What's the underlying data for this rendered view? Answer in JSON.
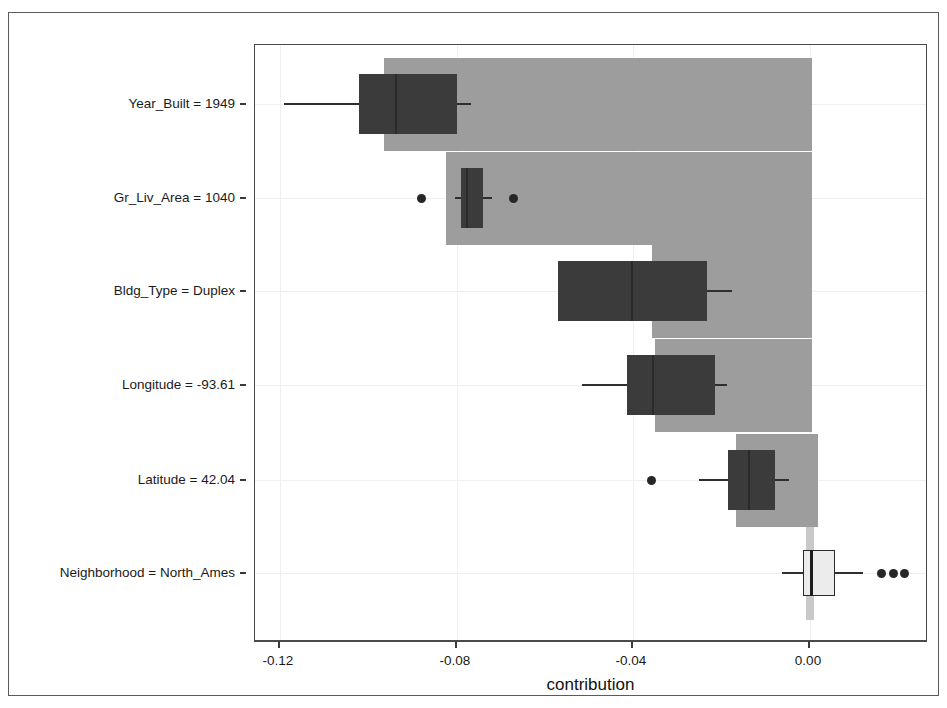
{
  "chart_data": {
    "type": "bar",
    "subtype": "break-down-boxplot-waterfall",
    "title": "",
    "xlabel": "contribution",
    "ylabel": "",
    "xlim": [
      -0.1332,
      0.0191
    ],
    "xticks": [
      -0.12,
      -0.08,
      -0.04,
      0.0
    ],
    "xtick_labels": [
      "-0.12",
      "-0.08",
      "-0.04",
      "0.00"
    ],
    "grid": true,
    "grid_axis": "both",
    "categories": [
      "Year_Built = 1949",
      "Gr_Liv_Area = 1040",
      "Bldg_Type = Duplex",
      "Longitude = -93.61",
      "Latitude = 42.04",
      "Neighborhood = North_Ames"
    ],
    "bars": [
      {
        "label": "Year_Built = 1949",
        "start": -0.0965,
        "end": 0.0005,
        "color": "#9d9d9d"
      },
      {
        "label": "Gr_Liv_Area = 1040",
        "start": -0.0825,
        "end": 0.0005,
        "color": "#9d9d9d"
      },
      {
        "label": "Bldg_Type = Duplex",
        "start": -0.0357,
        "end": 0.0005,
        "color": "#9d9d9d"
      },
      {
        "label": "Longitude = -93.61",
        "start": -0.035,
        "end": 0.0005,
        "color": "#9d9d9d"
      },
      {
        "label": "Latitude = 42.04",
        "start": -0.0167,
        "end": 0.0019,
        "color": "#9d9d9d"
      },
      {
        "label": "Neighborhood = North_Ames",
        "start": -0.001,
        "end": 0.001,
        "color": "#c9c9c9"
      }
    ],
    "boxplots": [
      {
        "label": "Year_Built = 1949",
        "lower_whisker": -0.1192,
        "q1": -0.1021,
        "median": -0.094,
        "q3": -0.0799,
        "upper_whisker": -0.0768,
        "outliers": [],
        "fill": "#3b3b3b"
      },
      {
        "label": "Gr_Liv_Area = 1040",
        "lower_whisker": -0.0804,
        "q1": -0.079,
        "median": -0.078,
        "q3": -0.0741,
        "upper_whisker": -0.072,
        "outliers": [
          -0.0879,
          -0.0672
        ],
        "fill": "#3b3b3b"
      },
      {
        "label": "Bldg_Type = Duplex",
        "lower_whisker": -0.0571,
        "q1": -0.0571,
        "median": -0.0406,
        "q3": -0.0233,
        "upper_whisker": -0.0177,
        "outliers": [],
        "fill": "#3b3b3b"
      },
      {
        "label": "Longitude = -93.61",
        "lower_whisker": -0.0516,
        "q1": -0.0414,
        "median": -0.0357,
        "q3": -0.0215,
        "upper_whisker": -0.0188,
        "outliers": [],
        "fill": "#3b3b3b"
      },
      {
        "label": "Latitude = 42.04",
        "lower_whisker": -0.0251,
        "q1": -0.0186,
        "median": -0.014,
        "q3": -0.0079,
        "upper_whisker": -0.0048,
        "outliers": [
          -0.0358
        ],
        "fill": "#3b3b3b"
      },
      {
        "label": "Neighborhood = North_Ames",
        "lower_whisker": -0.0063,
        "q1": -0.0016,
        "median": -0.0001,
        "q3": 0.0057,
        "upper_whisker": 0.012,
        "outliers": [
          0.0163,
          0.019,
          0.0215
        ],
        "fill": "#ececec"
      }
    ],
    "colors": {
      "bar_fill": "#9d9d9d",
      "bar_fill_last": "#c9c9c9",
      "box_dark": "#3b3b3b",
      "box_light": "#ececec",
      "line": "#2f2f2f",
      "panel_border": "#4a4a4a",
      "grid": "#efefef",
      "text": "#1a1a1a"
    }
  },
  "axis": {
    "title": "contribution"
  }
}
